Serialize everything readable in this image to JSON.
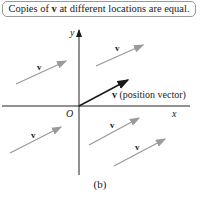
{
  "caption": {
    "prefix": "Copies of ",
    "bold": "v",
    "suffix": " at different locations are equal."
  },
  "axes": {
    "x_label": "x",
    "y_label": "y",
    "origin_label": "O"
  },
  "vectors": [
    {
      "label": "v",
      "from": [
        10,
        83
      ],
      "to": [
        66,
        62
      ],
      "type": "copy"
    },
    {
      "label": "v",
      "from": [
        96,
        66
      ],
      "to": [
        144,
        44
      ],
      "type": "copy"
    },
    {
      "label": "v",
      "from": [
        79,
        106
      ],
      "to": [
        128,
        80
      ],
      "type": "position",
      "annotation": "v (position vector)"
    },
    {
      "label": "v",
      "from": [
        10,
        153
      ],
      "to": [
        61,
        126
      ],
      "type": "copy"
    },
    {
      "label": "v",
      "from": [
        89,
        145
      ],
      "to": [
        139,
        117
      ],
      "type": "copy"
    },
    {
      "label": "v",
      "from": [
        114,
        166
      ],
      "to": [
        165,
        139
      ],
      "type": "copy"
    }
  ],
  "subfigure_label": "(b)",
  "colors": {
    "copy": "#9a9a9a",
    "position": "#1a1a1a",
    "axis": "#222222"
  }
}
